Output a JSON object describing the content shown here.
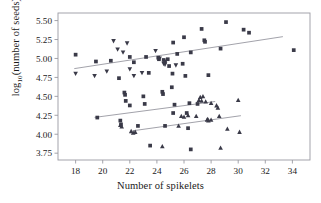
{
  "chart_data": {
    "type": "scatter",
    "title": "",
    "xlabel": "Number of spikelets",
    "ylabel_html": "log<sub>10</sub>(number of seeds)",
    "ylabel": "log10(number of seeds)",
    "xlim": [
      16.7,
      35.3
    ],
    "ylim": [
      3.66,
      5.6
    ],
    "xticks": [
      18,
      20,
      22,
      24,
      26,
      28,
      30,
      32,
      34
    ],
    "yticks": [
      "3.75",
      "4.00",
      "4.25",
      "4.50",
      "4.75",
      "5.00",
      "5.25",
      "5.50"
    ],
    "ytick_values": [
      3.75,
      4.0,
      4.25,
      4.5,
      4.75,
      5.0,
      5.25,
      5.5
    ],
    "grid": false,
    "legend": "none",
    "marker_color": "#3a3a48",
    "line_color": "#8a8a94",
    "frame_color": "#9a9aa2",
    "series": [
      {
        "name": "squares",
        "marker": "square",
        "points": [
          [
            18.0,
            5.05
          ],
          [
            19.5,
            4.96
          ],
          [
            20.6,
            4.97
          ],
          [
            21.2,
            4.74
          ],
          [
            21.6,
            4.55
          ],
          [
            21.65,
            4.52
          ],
          [
            21.7,
            4.44
          ],
          [
            22.0,
            5.02
          ],
          [
            22.3,
            4.95
          ],
          [
            23.0,
            4.5
          ],
          [
            23.1,
            4.4
          ],
          [
            23.2,
            5.02
          ],
          [
            23.4,
            4.81
          ],
          [
            24.1,
            5.01
          ],
          [
            24.15,
            4.99
          ],
          [
            24.4,
            4.56
          ],
          [
            24.45,
            4.53
          ],
          [
            24.5,
            4.98
          ],
          [
            24.6,
            4.96
          ],
          [
            24.8,
            4.99
          ],
          [
            24.9,
            4.9
          ],
          [
            25.1,
            4.62
          ],
          [
            25.15,
            4.8
          ],
          [
            25.2,
            5.21
          ],
          [
            25.3,
            4.39
          ],
          [
            25.5,
            5.06
          ],
          [
            25.9,
            4.93
          ],
          [
            26.0,
            5.28
          ],
          [
            26.1,
            4.77
          ],
          [
            26.4,
            4.41
          ],
          [
            26.5,
            5.08
          ],
          [
            27.0,
            4.4
          ],
          [
            27.3,
            5.39
          ],
          [
            27.5,
            5.24
          ],
          [
            27.55,
            5.22
          ],
          [
            27.8,
            4.78
          ],
          [
            28.7,
            5.13
          ],
          [
            29.1,
            5.48
          ],
          [
            30.4,
            5.38
          ],
          [
            30.8,
            5.34
          ],
          [
            34.1,
            5.11
          ],
          [
            19.6,
            4.22
          ],
          [
            21.3,
            4.18
          ],
          [
            21.35,
            4.13
          ],
          [
            22.0,
            4.38
          ],
          [
            22.6,
            4.11
          ],
          [
            23.5,
            3.85
          ],
          [
            24.6,
            4.11
          ],
          [
            25.2,
            4.28
          ],
          [
            26.2,
            4.28
          ],
          [
            26.3,
            4.08
          ],
          [
            26.5,
            3.8
          ]
        ]
      },
      {
        "name": "down-triangles",
        "marker": "triangle-down",
        "points": [
          [
            18.0,
            4.8
          ],
          [
            19.4,
            4.77
          ],
          [
            20.3,
            4.83
          ],
          [
            20.8,
            5.23
          ],
          [
            21.1,
            5.12
          ],
          [
            21.5,
            5.08
          ],
          [
            21.8,
            5.2
          ],
          [
            22.0,
            4.86
          ],
          [
            22.3,
            4.77
          ],
          [
            22.9,
            4.81
          ],
          [
            23.9,
            5.1
          ],
          [
            24.2,
            5.0
          ],
          [
            24.5,
            4.93
          ],
          [
            24.6,
            4.92
          ],
          [
            25.4,
            4.91
          ]
        ]
      },
      {
        "name": "up-triangles",
        "marker": "triangle-up",
        "points": [
          [
            21.3,
            4.12
          ],
          [
            21.4,
            4.1
          ],
          [
            22.1,
            4.04
          ],
          [
            22.25,
            4.02
          ],
          [
            22.4,
            4.03
          ],
          [
            24.4,
            3.84
          ],
          [
            25.6,
            4.11
          ],
          [
            25.8,
            4.24
          ],
          [
            26.0,
            4.23
          ],
          [
            26.3,
            4.25
          ],
          [
            26.9,
            4.24
          ],
          [
            27.1,
            4.45
          ],
          [
            27.2,
            4.49
          ],
          [
            27.3,
            4.44
          ],
          [
            27.4,
            4.5
          ],
          [
            27.6,
            4.43
          ],
          [
            27.7,
            4.19
          ],
          [
            27.75,
            4.2
          ],
          [
            27.8,
            4.18
          ],
          [
            28.0,
            4.41
          ],
          [
            28.0,
            4.19
          ],
          [
            28.4,
            4.38
          ],
          [
            28.5,
            4.35
          ],
          [
            28.6,
            4.24
          ],
          [
            28.7,
            3.82
          ],
          [
            29.2,
            4.07
          ],
          [
            30.0,
            4.45
          ],
          [
            30.1,
            4.03
          ]
        ]
      }
    ],
    "regression_lines": [
      {
        "name": "upper-line",
        "x": [
          17.9,
          33.3
        ],
        "y": [
          4.866,
          5.288
        ]
      },
      {
        "name": "middle-line",
        "x": [
          19.4,
          28.3
        ],
        "y": [
          4.222,
          4.432
        ]
      },
      {
        "name": "lower-line",
        "x": [
          22.2,
          30.2
        ],
        "y": [
          4.045,
          4.245
        ]
      }
    ]
  }
}
